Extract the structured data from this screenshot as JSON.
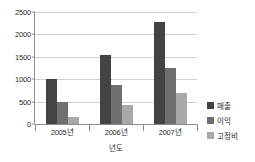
{
  "chart_data": {
    "type": "bar",
    "title": "",
    "xlabel": "년도",
    "ylabel": "",
    "categories": [
      "2005년",
      "2006년",
      "2007년"
    ],
    "series": [
      {
        "name": "매출",
        "color": "#434343",
        "values": [
          1000,
          1550,
          2280
        ]
      },
      {
        "name": "이익",
        "color": "#6f6f6f",
        "values": [
          500,
          860,
          1260
        ]
      },
      {
        "name": "고정비",
        "color": "#a9a9a9",
        "values": [
          150,
          430,
          700
        ]
      }
    ],
    "ylim": [
      0,
      2500
    ],
    "yticks": [
      0,
      500,
      1000,
      1500,
      2000,
      2500
    ],
    "ytick_labels": [
      "0",
      "500",
      "1000",
      "1500",
      "2000",
      "2500"
    ],
    "grid": true,
    "legend_position": "right"
  }
}
